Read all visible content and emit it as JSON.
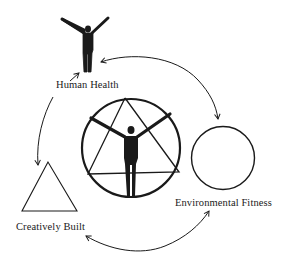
{
  "diagram": {
    "type": "cycle",
    "nodes": [
      {
        "id": "human-health",
        "label": "Human Health",
        "symbol": "human-figure-icon"
      },
      {
        "id": "environmental-fitness",
        "label": "Environmental Fitness",
        "symbol": "circle-icon"
      },
      {
        "id": "creatively-built",
        "label": "Creatively Built",
        "symbol": "triangle-icon"
      }
    ],
    "center": {
      "symbol": "figure-in-triangle-in-circle-icon"
    },
    "edges": [
      {
        "from": "human-health",
        "to": "environmental-fitness",
        "direction": "bidirectional"
      },
      {
        "from": "environmental-fitness",
        "to": "creatively-built",
        "direction": "bidirectional"
      },
      {
        "from": "creatively-built",
        "to": "human-health",
        "direction": "bidirectional"
      }
    ],
    "colors": {
      "ink": "#1a1a1a",
      "background": "#ffffff"
    }
  },
  "labels": {
    "human_health": "Human Health",
    "environmental_fitness": "Environmental Fitness",
    "creatively_built": "Creatively Built"
  }
}
